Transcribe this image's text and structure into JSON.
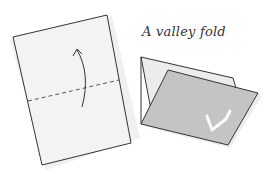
{
  "diagram": {
    "caption": "A valley fold",
    "figures": [
      {
        "name": "unfolded-sheet",
        "fold_line": "dashed horizontal",
        "arrow": "curved upward arrow indicating fold direction"
      },
      {
        "name": "folded-sheet",
        "state": "bottom half folded up over top half",
        "mark": "check/L-shaped highlight"
      }
    ],
    "colors": {
      "paper": "#f2f2f2",
      "paper_shadow": "#e2e2e2",
      "folded_flap": "#c4c4c4",
      "outline": "#333333",
      "fold_line": "#555555",
      "highlight": "#ffffff"
    }
  }
}
